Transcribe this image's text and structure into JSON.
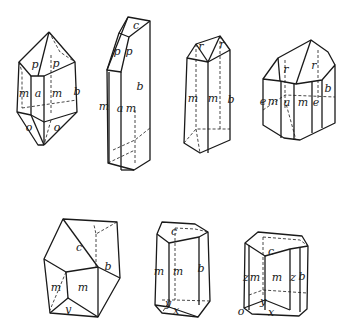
{
  "figure": {
    "crystals": [
      {
        "id": "crystal-1",
        "labels": [
          "p",
          "p",
          "m",
          "a",
          "m",
          "b",
          "o",
          "o"
        ]
      },
      {
        "id": "crystal-2",
        "labels": [
          "c",
          "p",
          "p",
          "b",
          "m",
          "a",
          "m"
        ]
      },
      {
        "id": "crystal-3",
        "labels": [
          "r",
          "r",
          "m",
          "m",
          "b"
        ]
      },
      {
        "id": "crystal-4",
        "labels": [
          "r",
          "r",
          "e",
          "m",
          "a",
          "m",
          "e",
          "b"
        ]
      },
      {
        "id": "crystal-5",
        "labels": [
          "c",
          "b",
          "m",
          "m",
          "y"
        ]
      },
      {
        "id": "crystal-6",
        "labels": [
          "c",
          "m",
          "m",
          "b",
          "y",
          "x"
        ]
      },
      {
        "id": "crystal-7",
        "labels": [
          "c",
          "z",
          "m",
          "m",
          "z",
          "b",
          "o",
          "y",
          "x"
        ]
      }
    ]
  }
}
